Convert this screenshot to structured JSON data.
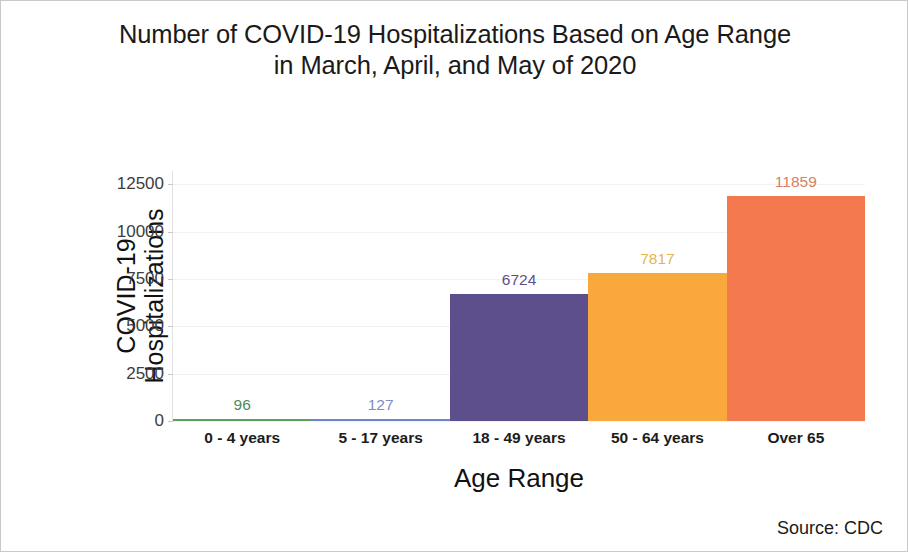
{
  "figure": {
    "title_line1": "Number of COVID-19 Hospitalizations Based on Age Range",
    "title_line2": "in March, April, and May of 2020",
    "source_note": "Source: CDC",
    "ylabel_line1": "COVID-19",
    "ylabel_line2": "Hospitalizations",
    "xlabel": "Age Range"
  },
  "chart_data": {
    "type": "bar",
    "title": "Number of COVID-19 Hospitalizations Based on Age Range in March, April, and May of 2020",
    "xlabel": "Age Range",
    "ylabel": "COVID-19 Hospitalizations",
    "categories": [
      "0 - 4 years",
      "5 - 17 years",
      "18 - 49 years",
      "50 - 64 years",
      "Over 65"
    ],
    "values": [
      96,
      127,
      6724,
      7817,
      11859
    ],
    "value_labels": [
      "96",
      "127",
      "6724",
      "7817",
      "11859"
    ],
    "colors": [
      "#5FA05F",
      "#6F86CE",
      "#5D4E8C",
      "#F9A93B",
      "#F4794E"
    ],
    "label_colors": [
      "#4E8B57",
      "#7B8CC8",
      "#5D4E8C",
      "#E8B44A",
      "#D98060"
    ],
    "ylim": [
      0,
      13200
    ],
    "yticks": [
      0,
      2500,
      5000,
      7500,
      10000,
      12500
    ],
    "ytick_labels": [
      "0",
      "2500",
      "5000",
      "7500",
      "10000",
      "12500"
    ],
    "grid": true,
    "legend": "none",
    "annotations": [
      "Source: CDC"
    ]
  }
}
